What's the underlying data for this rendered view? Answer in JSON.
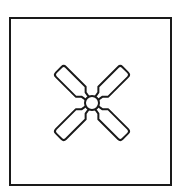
{
  "figure": {
    "frame": {
      "shape": "square",
      "stroke": "#1a1a1a"
    },
    "fan": {
      "blades": 4,
      "hub": "circle",
      "stroke": "#1a1a1a",
      "fill": "#ffffff"
    }
  }
}
